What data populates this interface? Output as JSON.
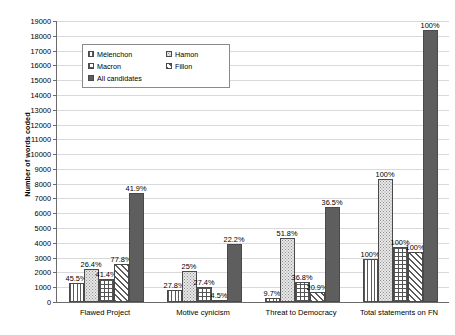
{
  "chart_data": {
    "type": "bar",
    "title": "",
    "xlabel": "",
    "ylabel": "Number of words coded",
    "ylim": [
      0,
      19000
    ],
    "ytick_step": 1000,
    "yticks": [
      "19000",
      "18000",
      "17000",
      "16000",
      "15000",
      "14000",
      "13000",
      "12000",
      "11000",
      "10000",
      "9000",
      "8000",
      "7000",
      "6000",
      "5000",
      "4000",
      "3000",
      "2000",
      "1000",
      "0"
    ],
    "grid": true,
    "legend_position": "upper-left-inside",
    "categories": [
      "Flawed Project",
      "Motive cynicism",
      "Threat to Democracy",
      "Total statements on FN"
    ],
    "series": [
      {
        "name": "Mélenchon",
        "pattern": "vertical-stripes",
        "values": [
          1300,
          800,
          280,
          2900
        ],
        "labels": [
          "45.5%",
          "27.8%",
          "9.7%",
          "100%"
        ]
      },
      {
        "name": "Hamon",
        "pattern": "stipple-dots",
        "values": [
          2200,
          2080,
          4300,
          8300
        ],
        "labels": [
          "26.4%",
          "25%",
          "51.8%",
          "100%"
        ]
      },
      {
        "name": "Macron",
        "pattern": "checkerboard",
        "values": [
          1550,
          1030,
          1380,
          3750
        ],
        "labels": [
          "41.4%",
          "27.4%",
          "36.8%",
          "100%"
        ]
      },
      {
        "name": "Fillon",
        "pattern": "diagonal-hatch",
        "values": [
          2550,
          150,
          680,
          3380
        ],
        "labels": [
          "77.8%",
          "4.5%",
          "20.9%",
          "100%"
        ]
      },
      {
        "name": "All candidates",
        "pattern": "solid-gray",
        "values": [
          7400,
          3900,
          6450,
          18400
        ],
        "labels": [
          "41.9%",
          "22.2%",
          "36.5%",
          "100%"
        ]
      }
    ]
  },
  "legend": {
    "items": [
      {
        "label": "Mélenchon"
      },
      {
        "label": "Hamon"
      },
      {
        "label": "Macron"
      },
      {
        "label": "Fillon"
      },
      {
        "label": "All candidates"
      }
    ]
  },
  "colors": {
    "axis": "#6b6b6b",
    "grid": "#d9d9d9",
    "bar_border": "#4a4a4a",
    "solid_series": "#5e5e5e",
    "background": "#ffffff"
  }
}
